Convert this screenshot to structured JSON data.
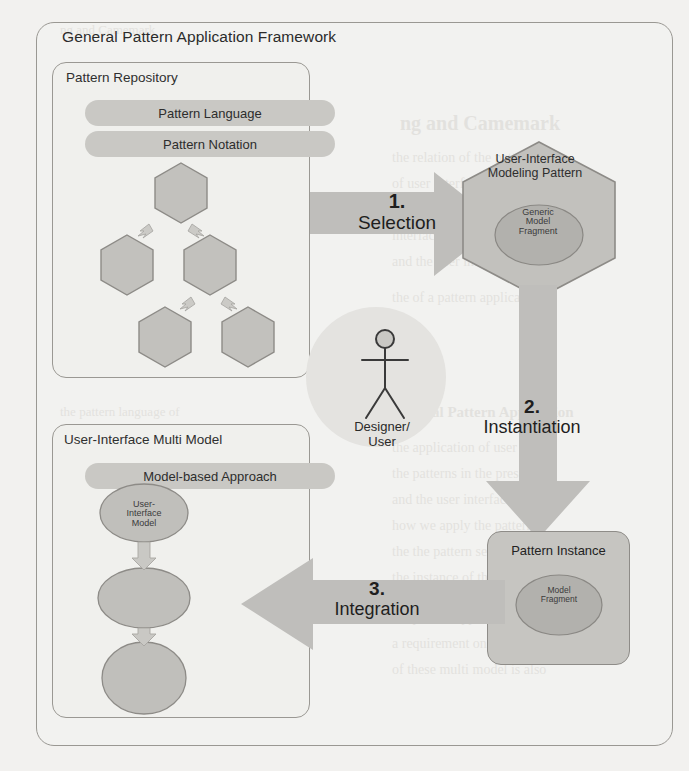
{
  "frame": {
    "title": "General Pattern Application Framework"
  },
  "repository": {
    "title": "Pattern Repository",
    "pills": [
      {
        "label": "Pattern Language"
      },
      {
        "label": "Pattern Notation"
      }
    ],
    "hexagons": [
      {
        "id": "hex-top"
      },
      {
        "id": "hex-mid-left"
      },
      {
        "id": "hex-mid-right"
      },
      {
        "id": "hex-bottom-left"
      },
      {
        "id": "hex-bottom-right"
      }
    ]
  },
  "multi_model": {
    "title": "User-Interface Multi Model",
    "pill": {
      "label": "Model-based Approach"
    },
    "ellipses": [
      {
        "label": "User-\nInterface\nModel"
      },
      {
        "label": ""
      },
      {
        "label": ""
      }
    ],
    "top_ellipse_label_lines": [
      "User-",
      "Interface",
      "Model"
    ]
  },
  "pattern": {
    "title_lines": [
      "User-Interface",
      "Modeling Pattern"
    ],
    "inner_ellipse_lines": [
      "Generic",
      "Model",
      "Fragment"
    ]
  },
  "instance": {
    "title": "Pattern Instance",
    "inner_ellipse_lines": [
      "Model",
      "Fragment"
    ]
  },
  "actor": {
    "label_lines": [
      "Designer/",
      "User"
    ],
    "icon": "stick-figure-icon"
  },
  "arrows": [
    {
      "id": "selection",
      "number": "1.",
      "label": "Selection",
      "direction": "right"
    },
    {
      "id": "instantiation",
      "number": "2.",
      "label": "Instantiation",
      "direction": "down"
    },
    {
      "id": "integration",
      "number": "3.",
      "label": "Integration",
      "direction": "left"
    }
  ],
  "colors": {
    "page_background": "#f2f1ef",
    "outline": "#9a9893",
    "pill_fill": "#c9c8c4",
    "shape_fill": "#c6c5c1",
    "arrow_fill": "#bfbebb",
    "inner_ellipse_fill": "#b2b1ad",
    "text": "#2b2b2b",
    "bleed_text": "#cfcdc8"
  },
  "background_bleed": [
    {
      "text": "ng and Camemark",
      "x": 400,
      "y": 112,
      "size": 20,
      "weight": "bold"
    },
    {
      "text": "the relation of the pattern",
      "x": 392,
      "y": 150,
      "size": 14
    },
    {
      "text": "of user interface models",
      "x": 392,
      "y": 176,
      "size": 14
    },
    {
      "text": "based design of the user",
      "x": 392,
      "y": 202,
      "size": 14
    },
    {
      "text": "interfaces with model",
      "x": 392,
      "y": 228,
      "size": 14
    },
    {
      "text": "and the user interface",
      "x": 392,
      "y": 254,
      "size": 14
    },
    {
      "text": "the of a pattern application",
      "x": 392,
      "y": 290,
      "size": 14
    },
    {
      "text": "General Pattern Application",
      "x": 392,
      "y": 404,
      "size": 15,
      "weight": "bold"
    },
    {
      "text": "the application of user",
      "x": 392,
      "y": 440,
      "size": 14
    },
    {
      "text": "the patterns in the presented",
      "x": 392,
      "y": 466,
      "size": 14
    },
    {
      "text": "and the user interface model",
      "x": 392,
      "y": 492,
      "size": 14
    },
    {
      "text": "how we apply the pattern",
      "x": 392,
      "y": 518,
      "size": 14
    },
    {
      "text": "the the pattern selection",
      "x": 392,
      "y": 544,
      "size": 14
    },
    {
      "text": "the instance of the model",
      "x": 392,
      "y": 570,
      "size": 14
    },
    {
      "text": "the pattern application of",
      "x": 392,
      "y": 610,
      "size": 14
    },
    {
      "text": "a requirement on the",
      "x": 392,
      "y": 636,
      "size": 14
    },
    {
      "text": "of these multi model is also",
      "x": 392,
      "y": 662,
      "size": 14
    },
    {
      "text": "ng and Camemark",
      "x": 60,
      "y": 22,
      "size": 13
    },
    {
      "text": "the pattern language of",
      "x": 60,
      "y": 404,
      "size": 13
    }
  ]
}
